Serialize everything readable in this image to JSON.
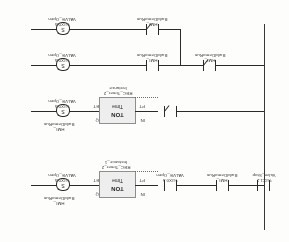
{
  "document": {
    "type": "ladder-logic-diagram",
    "standard": "IEC 61131-3 Ladder Diagram (LD)",
    "orientation": "rotated-180",
    "background_color": "#fdfdfb",
    "line_color": "#2e2e2e",
    "block_fill_color": "#e9e9e9"
  },
  "rungs": [
    {
      "id": "rung-1",
      "elements": {
        "coil": {
          "symbol": "S",
          "address": "%IX0.5",
          "name": "VALVE_Open"
        },
        "contact": {
          "symbol": "NC",
          "address": "HMI_",
          "name": "BuildDemoRun"
        }
      }
    },
    {
      "id": "rung-2",
      "elements": {
        "coil": {
          "symbol": "S",
          "address": "%IX0.5",
          "name": "VALVE_Open"
        },
        "contact_a": {
          "symbol": "NO",
          "address": "HMI_",
          "name": "BuildDemoRun"
        },
        "contact_b": {
          "symbol": "NC",
          "address": "HMI_",
          "name": "BuildDemoRun"
        }
      }
    },
    {
      "id": "rung-3",
      "elements": {
        "coil": {
          "symbol": "S",
          "address": "%IX0.5",
          "name": "VALVE_Open"
        },
        "timer": {
          "type": "TON",
          "sub": "Time",
          "instance_line1": "REC_Timer_2",
          "instance_line2": "Instance",
          "pin_in": "IN",
          "pin_pt": "PT",
          "pin_q": "Q",
          "pin_et": "ET"
        },
        "out_label": {
          "address": "HMI_",
          "name": "BuildDemoRun"
        },
        "contact": {
          "symbol": "NC",
          "address": "%IX0.5",
          "name": "VALVE_Open"
        }
      }
    },
    {
      "id": "rung-4",
      "elements": {
        "coil": {
          "symbol": "S",
          "address": "%IX0.5",
          "name": "VALVE_Open"
        },
        "timer": {
          "type": "TON",
          "sub": "Time",
          "instance_line1": "REC_Timer_2",
          "instance_line2": "Instance_1",
          "pin_in": "IN",
          "pin_pt": "PT",
          "pin_q": "Q",
          "pin_et": "ET"
        },
        "out_label": {
          "address": "HMI_",
          "name": "BuildDemoRun"
        },
        "contact_a": {
          "symbol": "NO",
          "address": "%IX0.5",
          "name": "VALVE_Open"
        },
        "contact_b": {
          "symbol": "NO",
          "address": "HMI_",
          "name": "BuildDemoRun"
        },
        "contact_c": {
          "symbol": "NO",
          "address": "%IX1.2",
          "name": "Valve_Stop"
        }
      }
    }
  ],
  "symbols": {
    "set_coil": "S",
    "normally_open": "| |",
    "normally_closed": "|/|"
  }
}
